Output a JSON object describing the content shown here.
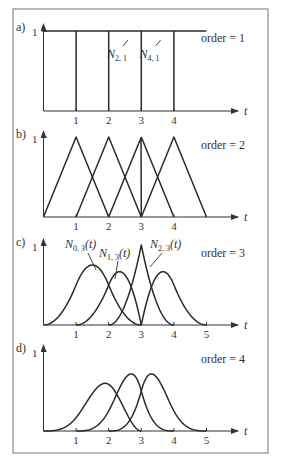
{
  "figure": {
    "knot_vector": [
      0,
      1,
      2,
      3,
      3,
      4,
      5
    ],
    "axis_variable": "t",
    "y_tick_label": "1",
    "frame_color": "#8a8a8a",
    "curve_color": "#2a2a2a"
  },
  "panels": [
    {
      "id": "a",
      "label": "a)",
      "order": 1,
      "order_label": "order = 1",
      "x_ticks": [
        "1",
        "2",
        "3",
        "4"
      ],
      "annotations": [
        {
          "text": "N",
          "sub": "2, 1",
          "target_t": 2.5
        },
        {
          "text": "N",
          "sub": "4, 1",
          "target_t": 3.5
        }
      ]
    },
    {
      "id": "b",
      "label": "b)",
      "order": 2,
      "order_label": "order = 2",
      "x_ticks": [
        "1",
        "2",
        "3",
        "4"
      ],
      "annotations": []
    },
    {
      "id": "c",
      "label": "c)",
      "order": 3,
      "order_label": "order = 3",
      "x_ticks": [
        "1",
        "2",
        "3",
        "4",
        "5"
      ],
      "annotations": [
        {
          "text": "N",
          "sub": "0, 3",
          "suffix": "(t)"
        },
        {
          "text": "N",
          "sub": "1, 3",
          "suffix": "(t)"
        },
        {
          "text": "N",
          "sub": "2, 3",
          "suffix": "(t)"
        }
      ]
    },
    {
      "id": "d",
      "label": "d)",
      "order": 4,
      "order_label": "order = 4",
      "x_ticks": [
        "1",
        "2",
        "3",
        "4",
        "5"
      ],
      "annotations": []
    }
  ],
  "chart_data": {
    "type": "line",
    "xlabel": "t",
    "ylabel": "",
    "ylim": [
      0,
      1
    ],
    "grid": false,
    "series": [
      {
        "name": "order = 1",
        "description": "piecewise-constant unit boxes on [0,1),[1,2),[2,3),[3,4),[4,5)",
        "peak_values": [
          1,
          1,
          1,
          1,
          1
        ]
      },
      {
        "name": "order = 2",
        "description": "hat functions; N peaks at t=1,2,3(double knot, vertical edge),3,4",
        "peak_values": [
          1,
          1,
          1,
          1,
          1
        ]
      },
      {
        "name": "order = 3",
        "description": "quadratic bumps; cusp at t=3 with value 1",
        "peak_values": [
          0.67,
          0.5,
          1.0,
          0.5,
          0.67
        ]
      },
      {
        "name": "order = 4",
        "description": "cubic bumps",
        "peak_values": [
          0.58,
          0.72,
          0.72,
          0.58,
          0.67
        ]
      }
    ]
  }
}
